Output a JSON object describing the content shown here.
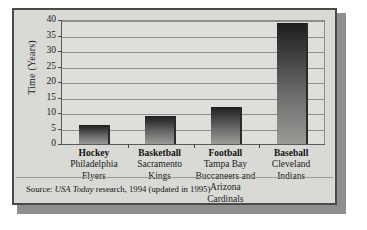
{
  "chart_data": {
    "type": "bar",
    "title": "",
    "subtitle": "",
    "xlabel": "",
    "ylabel": "Time (Years)",
    "ylim": [
      0,
      40
    ],
    "ytick_step": 5,
    "yticks": [
      "40",
      "35",
      "30",
      "25",
      "20",
      "15",
      "10",
      "5",
      "0"
    ],
    "grid": true,
    "legend": false,
    "categories": [
      "Hockey",
      "Basketball",
      "Football",
      "Baseball"
    ],
    "values": [
      6,
      9,
      12,
      39
    ],
    "category_sublabels": [
      "Philadelphia Flyers",
      "Sacramento Kings",
      "Tampa Bay Buccaneers and Arizona Cardinals",
      "Cleveland Indians"
    ],
    "bars": [
      {
        "sport": "Hockey",
        "team_lines": [
          "Philadelphia",
          "Flyers"
        ],
        "value": 6
      },
      {
        "sport": "Basketball",
        "team_lines": [
          "Sacramento",
          "Kings"
        ],
        "value": 9
      },
      {
        "sport": "Football",
        "team_lines": [
          "Tampa Bay",
          "Buccaneers and",
          "Arizona Cardinals"
        ],
        "value": 12
      },
      {
        "sport": "Baseball",
        "team_lines": [
          "Cleveland",
          "Indians"
        ],
        "value": 39
      }
    ],
    "annotations": [],
    "colors": {
      "bar_top": "#1e1e1e",
      "bar_bottom": "#9a9a97",
      "plot_background": "#dededa",
      "figure_background": "#d9d9d6",
      "gridline": "#8e8e8e",
      "frame": "#4a4a4a"
    }
  },
  "source": {
    "prefix": "Source: ",
    "publication": "USA Today",
    "suffix": " research, 1994 (updated in 1995)"
  }
}
